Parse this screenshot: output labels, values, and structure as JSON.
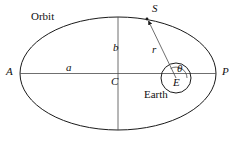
{
  "figure": {
    "background_color": "#ffffff",
    "stroke_color": "#1a1a1a",
    "text_color": "#101010",
    "width": 239,
    "height": 145
  },
  "labels": {
    "orbit": "Orbit",
    "satellite": "S",
    "apogee": "A",
    "perigee": "P",
    "semi_major_axis": "a",
    "semi_minor_axis": "b",
    "center": "C",
    "radius": "r",
    "true_anomaly": "θ",
    "earth_center": "E",
    "earth": "Earth"
  },
  "geometry": {
    "ellipse": {
      "center_x": 118,
      "center_y": 73.5,
      "radius_x": 98,
      "radius_y": 56.5
    },
    "earth_circle": {
      "center_x": 176,
      "center_y": 78,
      "radius": 15
    },
    "theta_arc": {
      "center_x": 176,
      "center_y": 78,
      "radius": 11
    },
    "major_axis": {
      "x1": 20,
      "y1": 73.5,
      "x2": 216,
      "y2": 73.5
    },
    "minor_axis": {
      "x1": 118,
      "y1": 17,
      "x2": 118,
      "y2": 130
    },
    "radius_vector": {
      "x1": 176,
      "y1": 78,
      "x2": 147,
      "y2": 19,
      "arrow": "to-satellite"
    },
    "satellite_point": {
      "x": 147,
      "y": 19
    }
  }
}
